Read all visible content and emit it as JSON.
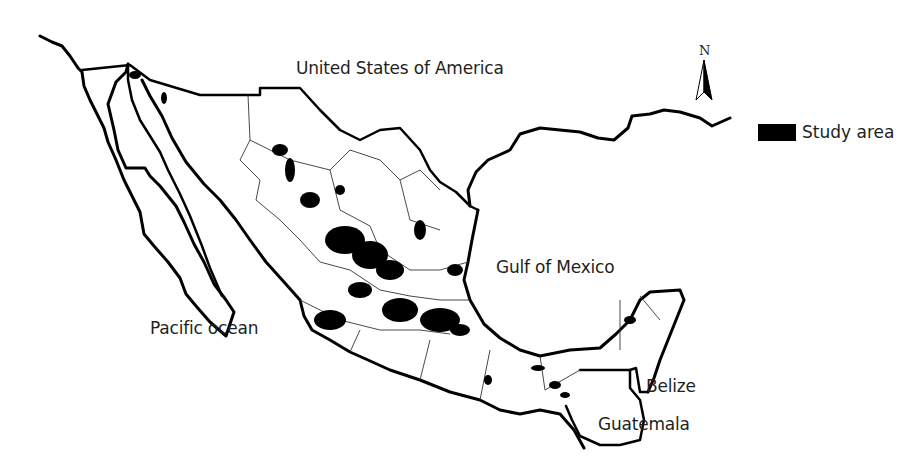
{
  "map": {
    "title": "",
    "labels": {
      "usa": "United States of America",
      "gulf": "Gulf of Mexico",
      "pacific": "Pacific ocean",
      "belize": "Belize",
      "guatemala": "Guatemala"
    },
    "north_arrow": {
      "letter": "N",
      "icon": "north-arrow-icon"
    },
    "legend": {
      "items": [
        {
          "label": "Study area",
          "color": "#000000",
          "symbol": "filled-rectangle"
        }
      ]
    },
    "colors": {
      "background": "#ffffff",
      "coastline": "#000000",
      "state_borders": "#333333",
      "study_area": "#000000",
      "text": "#231f20"
    }
  }
}
